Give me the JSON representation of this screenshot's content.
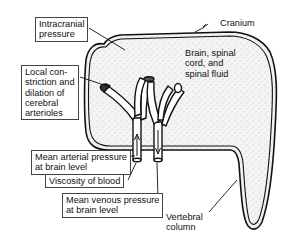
{
  "figure": {
    "colors": {
      "outline": "#111111",
      "fill_stipple": "#f2f2f2",
      "background": "#ffffff"
    }
  },
  "labels": {
    "intracranial_pressure": "Intracranial\npressure",
    "cranium": "Cranium",
    "brain": "Brain, spinal\ncord, and\nspinal fluid",
    "local_constriction": "Local con-\nstriction and\ndilation of\ncerebral\narterioles",
    "mean_arterial_pressure": "Mean arterial pressure\nat brain level",
    "viscosity": "Viscosity of blood",
    "mean_venous_pressure": "Mean venous pressure\nat brain level",
    "vertebral_column": "Vertebral\ncolumn"
  },
  "flow_arrows": {
    "artery": "up",
    "vein": "down"
  }
}
